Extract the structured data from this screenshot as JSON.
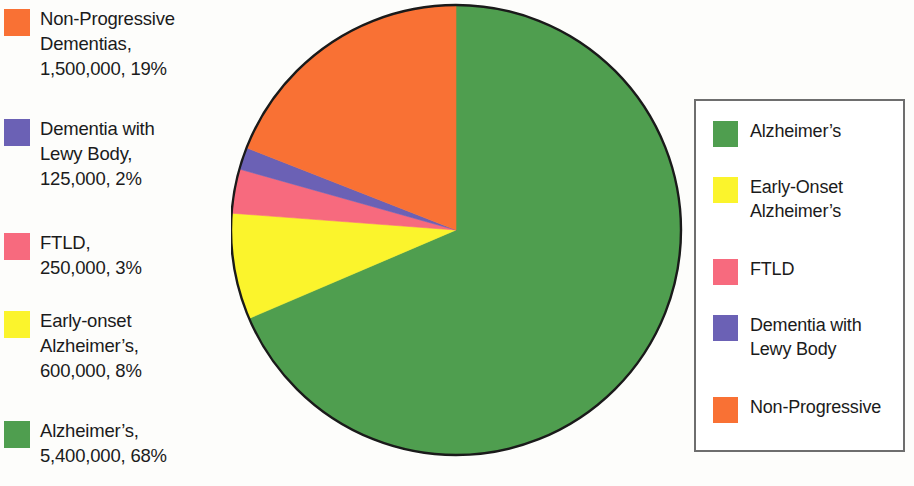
{
  "chart_data": {
    "type": "pie",
    "title": "",
    "subtitle": "",
    "xlabel": "",
    "ylabel": "",
    "legend_position": "right",
    "grid": false,
    "start_angle_deg": 0,
    "direction": "clockwise",
    "center": {
      "x": 456,
      "y": 230,
      "radius": 225
    },
    "categories": [
      "Alzheimer's",
      "Early-onset Alzheimer's",
      "FTLD",
      "Dementia with Lewy Body",
      "Non-Progressive Dementias"
    ],
    "values": [
      5400000,
      600000,
      250000,
      125000,
      1500000
    ],
    "percents": [
      68,
      8,
      3,
      2,
      19
    ],
    "value_labels": [
      "5,400,000",
      "600,000",
      "250,000",
      "125,000",
      "1,500,000"
    ],
    "percent_labels": [
      "68%",
      "8%",
      "3%",
      "2%",
      "19%"
    ],
    "colors": [
      "#4f9e4f",
      "#fbf42c",
      "#f76a7e",
      "#6b61b5",
      "#f97134"
    ],
    "sweep_degrees": [
      244.8,
      28.8,
      10.8,
      7.2,
      68.4
    ],
    "total": 7875000,
    "outline_color": "#1a1a1a",
    "annotations": []
  },
  "data_labels": [
    {
      "color": "#f97134",
      "swatch_name": "swatch-non-progressive",
      "text": "Non-Progressive\nDementias,\n1,500,000, 19%"
    },
    {
      "color": "#6b61b5",
      "swatch_name": "swatch-lewy-body",
      "text": "Dementia with\nLewy Body,\n125,000, 2%"
    },
    {
      "color": "#f76a7e",
      "swatch_name": "swatch-ftld",
      "text": "FTLD,\n250,000, 3%"
    },
    {
      "color": "#fbf42c",
      "swatch_name": "swatch-early-onset",
      "text": "Early-onset\nAlzheimer’s,\n600,000, 8%"
    },
    {
      "color": "#4f9e4f",
      "swatch_name": "swatch-alzheimers",
      "text": "Alzheimer’s,\n5,400,000, 68%"
    }
  ],
  "legend": {
    "border_color": "#6e6e6e",
    "items": [
      {
        "color": "#4f9e4f",
        "swatch_name": "legend-swatch-alzheimers",
        "label": "Alzheimer’s"
      },
      {
        "color": "#fbf42c",
        "swatch_name": "legend-swatch-early-onset",
        "label": "Early-Onset\nAlzheimer’s"
      },
      {
        "color": "#f76a7e",
        "swatch_name": "legend-swatch-ftld",
        "label": "FTLD"
      },
      {
        "color": "#6b61b5",
        "swatch_name": "legend-swatch-lewy-body",
        "label": "Dementia with\nLewy Body"
      },
      {
        "color": "#f97134",
        "swatch_name": "legend-swatch-non-progressive",
        "label": "Non-Progressive"
      }
    ]
  }
}
